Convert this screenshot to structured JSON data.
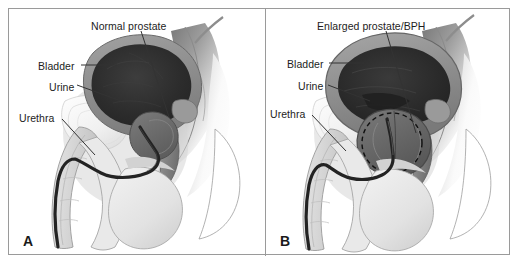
{
  "figure": {
    "background_color": "#ffffff",
    "border_color": "#9a9a9a",
    "text_color": "#1d1d1d"
  },
  "panels": [
    {
      "letter": "A",
      "condition": "Normal prostate",
      "labels": [
        {
          "name": "normal-prostate",
          "text": "Normal prostate",
          "x": 82,
          "y": 12
        },
        {
          "name": "bladder",
          "text": "Bladder",
          "x": 29,
          "y": 52
        },
        {
          "name": "urine",
          "text": "Urine",
          "x": 40,
          "y": 73
        },
        {
          "name": "urethra",
          "text": "Urethra",
          "x": 10,
          "y": 104
        }
      ]
    },
    {
      "letter": "B",
      "condition": "Enlarged prostate/BPH",
      "labels": [
        {
          "name": "enlarged-prostate",
          "text": "Enlarged prostate/BPH",
          "x": 51,
          "y": 12
        },
        {
          "name": "bladder",
          "text": "Bladder",
          "x": 21,
          "y": 50
        },
        {
          "name": "urine",
          "text": "Urine",
          "x": 32,
          "y": 72
        },
        {
          "name": "urethra",
          "text": "Urethra",
          "x": 4,
          "y": 100
        }
      ]
    }
  ],
  "colors": {
    "bladder_wall": "#8d8d8d",
    "urine_dark": "#2e2e2e",
    "prostate": "#6a6a6a",
    "soft_tissue": "#d8d8d8",
    "pale_tissue": "#ededed",
    "outline": "#4a4a4a",
    "urethra_line": "#232323",
    "leader_line": "#333333",
    "dashed_circle": "#111111"
  }
}
